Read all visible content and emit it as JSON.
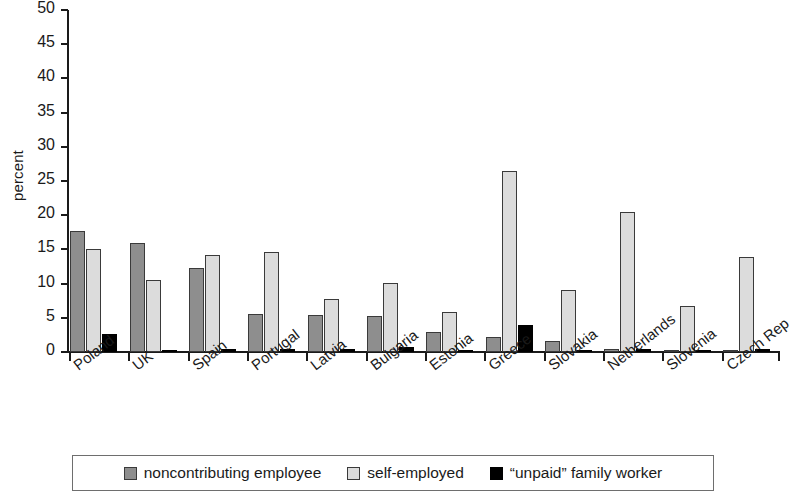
{
  "chart_data": {
    "type": "bar",
    "title": "",
    "xlabel": "",
    "ylabel": "percent",
    "ylim": [
      0,
      50
    ],
    "yticks": [
      0,
      5,
      10,
      15,
      20,
      25,
      30,
      35,
      40,
      45,
      50
    ],
    "grid": false,
    "legend_position": "bottom",
    "categories": [
      "Poland",
      "UK",
      "Spain",
      "Portugal",
      "Latvia",
      "Bulgaria",
      "Estonia",
      "Greece",
      "Slovakia",
      "Netherlands",
      "Slovenia",
      "Czech Rep"
    ],
    "series": [
      {
        "name": "noncontributing employee",
        "color": "#8e8e8e",
        "values": [
          17.7,
          15.9,
          12.3,
          5.5,
          5.4,
          5.2,
          2.9,
          2.2,
          1.6,
          0.5,
          0.3,
          0.1
        ]
      },
      {
        "name": "self-employed",
        "color": "#dcdcdc",
        "values": [
          15.0,
          10.6,
          14.2,
          14.6,
          7.7,
          10.1,
          5.8,
          26.5,
          9.0,
          20.5,
          6.8,
          13.9
        ]
      },
      {
        "name": "“unpaid” family worker",
        "color": "#000000",
        "values": [
          2.6,
          0.1,
          0.4,
          0.5,
          0.4,
          0.8,
          0.1,
          4.0,
          0.1,
          0.5,
          0.1,
          0.4
        ]
      }
    ]
  }
}
